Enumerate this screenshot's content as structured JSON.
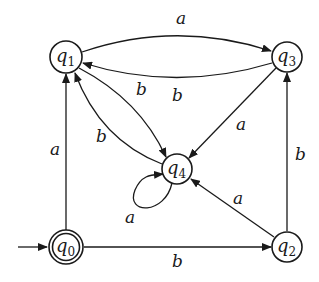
{
  "diagram": {
    "type": "finite-automaton",
    "colors": {
      "stroke": "#1a1a1a",
      "background": "#ffffff"
    },
    "start_state": "q0",
    "states": [
      {
        "id": "q0",
        "label": "q",
        "sub": "0",
        "accepting": true
      },
      {
        "id": "q1",
        "label": "q",
        "sub": "1",
        "accepting": false
      },
      {
        "id": "q2",
        "label": "q",
        "sub": "2",
        "accepting": false
      },
      {
        "id": "q3",
        "label": "q",
        "sub": "3",
        "accepting": false
      },
      {
        "id": "q4",
        "label": "q",
        "sub": "4",
        "accepting": false
      }
    ],
    "transitions": [
      {
        "from": "q1",
        "to": "q3",
        "symbol": "a"
      },
      {
        "from": "q3",
        "to": "q1",
        "symbol": "b"
      },
      {
        "from": "q1",
        "to": "q4",
        "symbol": "b"
      },
      {
        "from": "q4",
        "to": "q1",
        "symbol": "b"
      },
      {
        "from": "q3",
        "to": "q4",
        "symbol": "a"
      },
      {
        "from": "q4",
        "to": "q4",
        "symbol": "a"
      },
      {
        "from": "q0",
        "to": "q1",
        "symbol": "a"
      },
      {
        "from": "q0",
        "to": "q2",
        "symbol": "b"
      },
      {
        "from": "q2",
        "to": "q4",
        "symbol": "a"
      },
      {
        "from": "q2",
        "to": "q3",
        "symbol": "b"
      }
    ]
  }
}
